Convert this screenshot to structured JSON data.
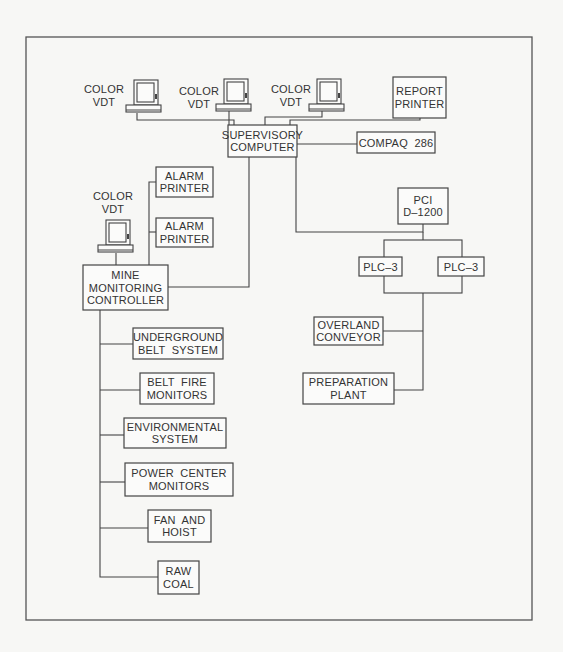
{
  "diagram": {
    "nodes": {
      "vdt_1": {
        "lines": [
          "COLOR",
          "VDT"
        ],
        "icon": "computer-terminal-icon"
      },
      "vdt_2": {
        "lines": [
          "COLOR",
          "VDT"
        ],
        "icon": "computer-terminal-icon"
      },
      "vdt_3": {
        "lines": [
          "COLOR",
          "VDT"
        ],
        "icon": "computer-terminal-icon"
      },
      "report_printer": {
        "lines": [
          "REPORT",
          "PRINTER"
        ]
      },
      "supervisory_computer": {
        "lines": [
          "SUPERVISORY",
          "COMPUTER"
        ]
      },
      "compaq": {
        "lines": [
          "COMPAQ  286"
        ]
      },
      "alarm_printer_1": {
        "lines": [
          "ALARM",
          "PRINTER"
        ]
      },
      "alarm_printer_2": {
        "lines": [
          "ALARM",
          "PRINTER"
        ]
      },
      "vdt_mine": {
        "lines": [
          "COLOR",
          "VDT"
        ],
        "icon": "computer-terminal-icon"
      },
      "mine_monitoring_controller": {
        "lines": [
          "MINE",
          "MONITORING",
          "CONTROLLER"
        ]
      },
      "pci": {
        "lines": [
          "PCI",
          "D–1200"
        ]
      },
      "plc_left": {
        "lines": [
          "PLC–3"
        ]
      },
      "plc_right": {
        "lines": [
          "PLC–3"
        ]
      },
      "overland_conveyor": {
        "lines": [
          "OVERLAND",
          "CONVEYOR"
        ]
      },
      "preparation_plant": {
        "lines": [
          "PREPARATION",
          "PLANT"
        ]
      },
      "underground_belt": {
        "lines": [
          "UNDERGROUND",
          "BELT  SYSTEM"
        ]
      },
      "belt_fire": {
        "lines": [
          "BELT  FIRE",
          "MONITORS"
        ]
      },
      "environmental": {
        "lines": [
          "ENVIRONMENTAL",
          "SYSTEM"
        ]
      },
      "power_center": {
        "lines": [
          "POWER  CENTER",
          "MONITORS"
        ]
      },
      "fan_hoist": {
        "lines": [
          "FAN  AND",
          "HOIST"
        ]
      },
      "raw_coal": {
        "lines": [
          "RAW",
          "COAL"
        ]
      }
    },
    "edges": [
      [
        "vdt_1",
        "supervisory_computer"
      ],
      [
        "vdt_2",
        "supervisory_computer"
      ],
      [
        "vdt_3",
        "supervisory_computer"
      ],
      [
        "report_printer",
        "supervisory_computer"
      ],
      [
        "supervisory_computer",
        "compaq"
      ],
      [
        "supervisory_computer",
        "mine_monitoring_controller"
      ],
      [
        "supervisory_computer",
        "pci"
      ],
      [
        "mine_monitoring_controller",
        "alarm_printer_1"
      ],
      [
        "mine_monitoring_controller",
        "alarm_printer_2"
      ],
      [
        "vdt_mine",
        "mine_monitoring_controller"
      ],
      [
        "pci",
        "plc_left"
      ],
      [
        "pci",
        "plc_right"
      ],
      [
        "plc_left",
        "overland_conveyor"
      ],
      [
        "plc_right",
        "overland_conveyor"
      ],
      [
        "plc_left",
        "preparation_plant"
      ],
      [
        "mine_monitoring_controller",
        "underground_belt"
      ],
      [
        "mine_monitoring_controller",
        "belt_fire"
      ],
      [
        "mine_monitoring_controller",
        "environmental"
      ],
      [
        "mine_monitoring_controller",
        "power_center"
      ],
      [
        "mine_monitoring_controller",
        "fan_hoist"
      ],
      [
        "mine_monitoring_controller",
        "raw_coal"
      ]
    ]
  }
}
